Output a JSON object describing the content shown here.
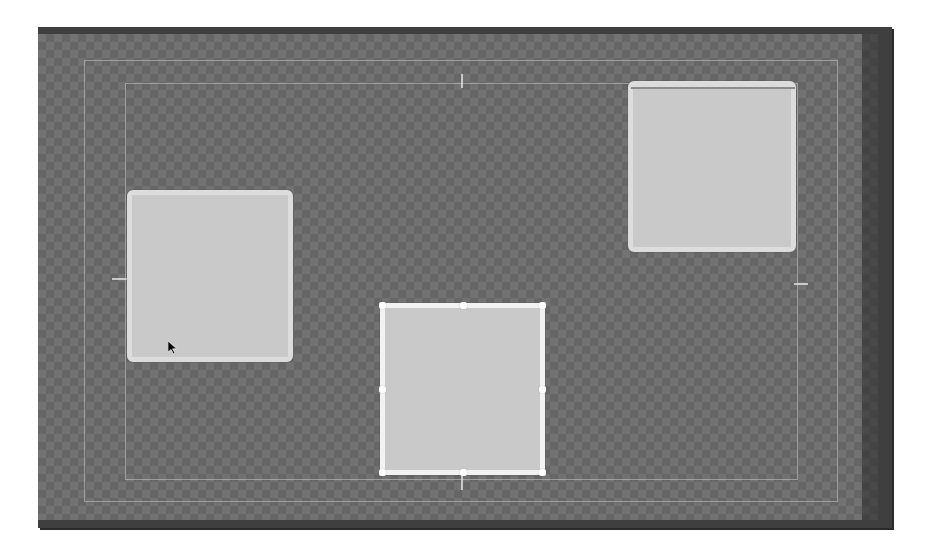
{
  "canvas": {
    "background": "transparency-checkerboard",
    "frame_color": "#3f3f3f",
    "checker_light": "#727272",
    "checker_dark": "#666666"
  },
  "guides": {
    "action_safe": {
      "visible": true
    },
    "title_safe": {
      "visible": true
    },
    "center_ticks": [
      "top",
      "bottom",
      "left",
      "right"
    ]
  },
  "shapes": [
    {
      "id": "left-square",
      "fill": "#c9c9c9",
      "stroke": "#dcdcdc",
      "selected": false
    },
    {
      "id": "right-square",
      "fill": "#c9c9c9",
      "stroke": "#dcdcdc",
      "selected": false
    },
    {
      "id": "middle-square",
      "fill": "#c9c9c9",
      "stroke": "#f2f2f2",
      "selected": true
    }
  ],
  "selection": {
    "handles": [
      "top-left",
      "top-center",
      "top-right",
      "middle-left",
      "middle-right",
      "bottom-left",
      "bottom-center",
      "bottom-right"
    ]
  },
  "cursor": {
    "icon": "arrow-pointer-icon"
  }
}
